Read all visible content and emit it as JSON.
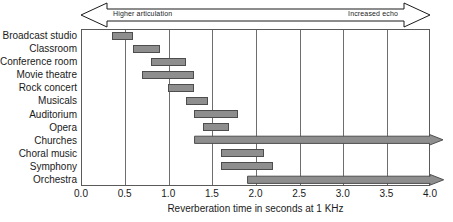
{
  "chart_data": {
    "type": "bar",
    "orientation": "horizontal",
    "title": "",
    "xlabel": "Reverberation time in seconds at 1 KHz",
    "ylabel": "",
    "xlim": [
      0.0,
      4.0
    ],
    "xticks": [
      "0.0",
      "0.5",
      "1.0",
      "1.5",
      "2.0",
      "2.5",
      "3.0",
      "3.5",
      "4.0"
    ],
    "xtick_values": [
      0.0,
      0.5,
      1.0,
      1.5,
      2.0,
      2.5,
      3.0,
      3.5,
      4.0
    ],
    "grid": true,
    "grid_axis": "x",
    "legend": null,
    "bar_color": "#8e8e8e",
    "bar_border_color": "#4d4d4d",
    "categories": [
      "Broadcast studio",
      "Classroom",
      "Conference room",
      "Movie theatre",
      "Rock concert",
      "Musicals",
      "Auditorium",
      "Opera",
      "Churches",
      "Choral music",
      "Symphony",
      "Orchestra"
    ],
    "ranges": [
      {
        "category": "Broadcast studio",
        "start": 0.35,
        "end": 0.6,
        "open_ended": false
      },
      {
        "category": "Classroom",
        "start": 0.6,
        "end": 0.9,
        "open_ended": false
      },
      {
        "category": "Conference room",
        "start": 0.8,
        "end": 1.2,
        "open_ended": false
      },
      {
        "category": "Movie theatre",
        "start": 0.7,
        "end": 1.3,
        "open_ended": false
      },
      {
        "category": "Rock concert",
        "start": 1.0,
        "end": 1.3,
        "open_ended": false
      },
      {
        "category": "Musicals",
        "start": 1.2,
        "end": 1.45,
        "open_ended": false
      },
      {
        "category": "Auditorium",
        "start": 1.3,
        "end": 1.8,
        "open_ended": false
      },
      {
        "category": "Opera",
        "start": 1.4,
        "end": 1.7,
        "open_ended": false
      },
      {
        "category": "Churches",
        "start": 1.3,
        "end": 4.0,
        "open_ended": true
      },
      {
        "category": "Choral music",
        "start": 1.6,
        "end": 2.1,
        "open_ended": false
      },
      {
        "category": "Symphony",
        "start": 1.6,
        "end": 2.2,
        "open_ended": false
      },
      {
        "category": "Orchestra",
        "start": 1.9,
        "end": 4.0,
        "open_ended": true
      }
    ],
    "annotations": [
      {
        "name": "higher-articulation",
        "text": "Higher articulation",
        "position": "top-left",
        "direction": "left"
      },
      {
        "name": "increased-echo",
        "text": "Increased echo",
        "position": "top-right",
        "direction": "right"
      }
    ]
  },
  "banner": {
    "left_label": "Higher articulation",
    "right_label": "Increased echo"
  },
  "axis": {
    "label": "Reverberation time in seconds at 1 KHz"
  }
}
